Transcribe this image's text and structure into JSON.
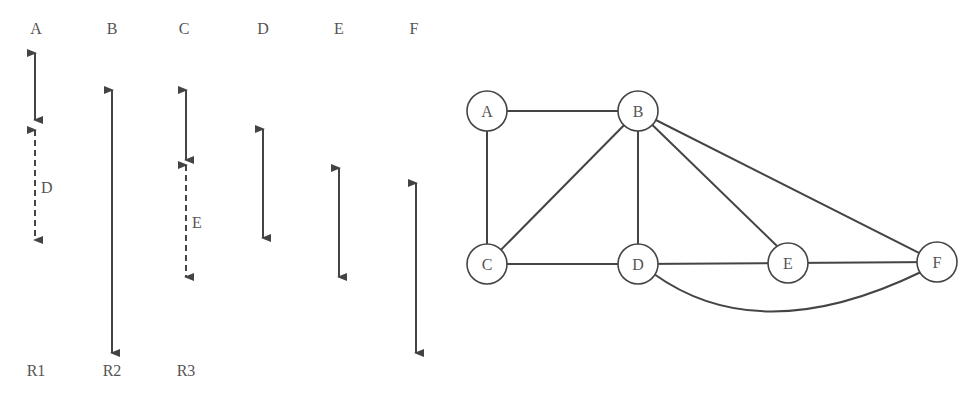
{
  "left_panel": {
    "columns": [
      {
        "header": "A",
        "x": 36
      },
      {
        "header": "B",
        "x": 112
      },
      {
        "header": "C",
        "x": 186
      },
      {
        "header": "D",
        "x": 263
      },
      {
        "header": "E",
        "x": 339
      },
      {
        "header": "F",
        "x": 416
      }
    ],
    "intervals": [
      {
        "column": "A",
        "x": 35,
        "y1": 53,
        "y2": 120,
        "style": "solid"
      },
      {
        "column": "A",
        "x": 35,
        "y1": 130,
        "y2": 240,
        "style": "dashed",
        "label": "D",
        "label_x": 41,
        "label_y": 193
      },
      {
        "column": "B",
        "x": 112,
        "y1": 90,
        "y2": 353,
        "style": "solid"
      },
      {
        "column": "C",
        "x": 186,
        "y1": 90,
        "y2": 160,
        "style": "solid"
      },
      {
        "column": "C",
        "x": 186,
        "y1": 165,
        "y2": 277,
        "style": "dashed",
        "label": "E",
        "label_x": 192,
        "label_y": 228
      },
      {
        "column": "D",
        "x": 263,
        "y1": 129,
        "y2": 238,
        "style": "solid"
      },
      {
        "column": "E",
        "x": 339,
        "y1": 168,
        "y2": 277,
        "style": "solid"
      },
      {
        "column": "F",
        "x": 416,
        "y1": 183,
        "y2": 353,
        "style": "solid"
      }
    ],
    "row_labels": [
      {
        "text": "R1",
        "x": 36
      },
      {
        "text": "R2",
        "x": 112
      },
      {
        "text": "R3",
        "x": 186
      }
    ]
  },
  "graph": {
    "nodes": [
      {
        "id": "A",
        "x": 487,
        "y": 111
      },
      {
        "id": "B",
        "x": 638,
        "y": 111
      },
      {
        "id": "C",
        "x": 487,
        "y": 264
      },
      {
        "id": "D",
        "x": 638,
        "y": 264
      },
      {
        "id": "E",
        "x": 788,
        "y": 263
      },
      {
        "id": "F",
        "x": 937,
        "y": 262
      }
    ],
    "edges": [
      {
        "from": "A",
        "to": "B"
      },
      {
        "from": "A",
        "to": "C"
      },
      {
        "from": "B",
        "to": "C"
      },
      {
        "from": "B",
        "to": "D"
      },
      {
        "from": "B",
        "to": "E"
      },
      {
        "from": "B",
        "to": "F"
      },
      {
        "from": "C",
        "to": "D"
      },
      {
        "from": "D",
        "to": "E"
      },
      {
        "from": "E",
        "to": "F"
      },
      {
        "from": "D",
        "to": "F",
        "curved": true
      }
    ]
  }
}
